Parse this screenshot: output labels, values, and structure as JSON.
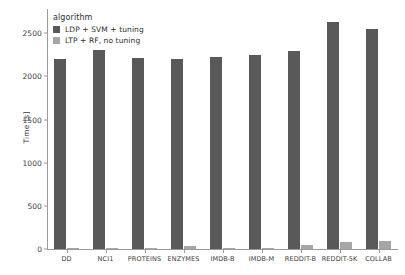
{
  "chart_data": {
    "type": "bar",
    "title": "",
    "xlabel": "",
    "ylabel": "Time [s]",
    "categories": [
      "DD",
      "NCI1",
      "PROTEINS",
      "ENZYMES",
      "IMDB-B",
      "IMDB-M",
      "REDDIT-B",
      "REDDIT-5K",
      "COLLAB"
    ],
    "series": [
      {
        "name": "LDP + SVM + tuning",
        "color": "#595959",
        "values": [
          2200,
          2300,
          2210,
          2200,
          2225,
          2250,
          2290,
          2630,
          2545
        ]
      },
      {
        "name": "LTP + RF, no tuning",
        "color": "#a6a6a6",
        "values": [
          6,
          8,
          6,
          30,
          10,
          10,
          45,
          81,
          93
        ]
      }
    ],
    "yticks": [
      0,
      500,
      1000,
      1500,
      2000,
      2500
    ],
    "ytick_labels": [
      "0",
      "500",
      "1000",
      "1500",
      "2000",
      "2500"
    ],
    "ylim": [
      0,
      2780
    ],
    "grid": false,
    "legend": {
      "title": "algorithm",
      "position": "upper-left",
      "entries": [
        "LDP + SVM + tuning",
        "LTP + RF, no tuning"
      ]
    }
  }
}
